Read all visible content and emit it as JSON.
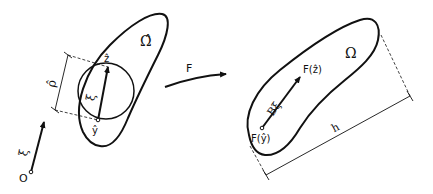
{
  "diagram": {
    "left_figure": {
      "domain_label": "Ω̂",
      "origin_label": "O",
      "vector_label": "ξ",
      "point_top_label": "ẑ",
      "point_bottom_label": "ŷ",
      "inner_vector_label": "ξ",
      "diameter_label": "ρ̂"
    },
    "mapping": {
      "label": "F"
    },
    "right_figure": {
      "domain_label": "Ω",
      "point_top_label": "F(ẑ)",
      "point_bottom_label": "F(ŷ)",
      "vector_label": "Bξ",
      "diameter_label": "h"
    },
    "colors": {
      "stroke": "#111111",
      "background": "#ffffff"
    }
  }
}
